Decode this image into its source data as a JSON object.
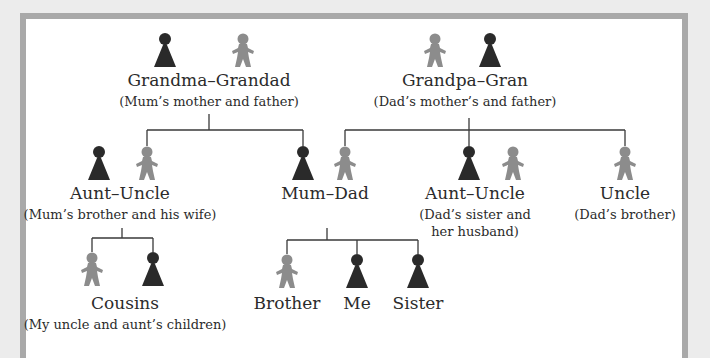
{
  "colors": {
    "female": "#2a2a2a",
    "male": "#8c8c8c",
    "line": "#3a3a3a",
    "frame_border": "#a9a9a9",
    "background": "#ececec"
  },
  "nodes": {
    "maternal_grandparents": {
      "name": "Grandma–Grandad",
      "desc": "(Mum’s mother and father)"
    },
    "paternal_grandparents": {
      "name": "Grandpa–Gran",
      "desc": "(Dad’s mother’s and father)"
    },
    "maternal_aunt_uncle": {
      "name": "Aunt–Uncle",
      "desc": "(Mum’s brother and his wife)"
    },
    "parents": {
      "name": "Mum–Dad"
    },
    "paternal_aunt_uncle": {
      "name": "Aunt–Uncle",
      "desc_line1": "(Dad’s sister and",
      "desc_line2": "her husband)"
    },
    "paternal_uncle": {
      "name": "Uncle",
      "desc": "(Dad’s brother)"
    },
    "cousins": {
      "name": "Cousins",
      "desc": "(My uncle and aunt’s children)"
    },
    "brother": {
      "name": "Brother"
    },
    "me": {
      "name": "Me"
    },
    "sister": {
      "name": "Sister"
    }
  },
  "icons": {
    "female": "female-figure-icon",
    "male": "male-figure-icon"
  }
}
